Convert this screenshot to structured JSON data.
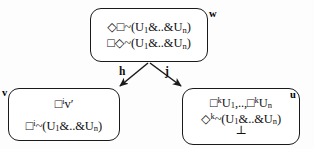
{
  "diagram": {
    "type": "modal-logic-kripke-frame",
    "background_color": "#fdfdfd",
    "stroke_color": "#1a1a1a",
    "nodes": [
      {
        "id": "w",
        "label": "w",
        "label_position": "top-right",
        "lines": [
          {
            "parts": [
              {
                "t": "◇□~(U"
              },
              {
                "t": "1",
                "style": "sub"
              },
              {
                "t": "&..&U"
              },
              {
                "t": "n",
                "style": "sub"
              },
              {
                "t": ")"
              }
            ],
            "plain": "◇□~(U1&..&Un)"
          },
          {
            "parts": [
              {
                "t": "□◇~(U"
              },
              {
                "t": "1",
                "style": "sub"
              },
              {
                "t": "&..&U"
              },
              {
                "t": "n",
                "style": "sub"
              },
              {
                "t": ")"
              }
            ],
            "plain": "□◇~(U1&..&Un)"
          }
        ]
      },
      {
        "id": "v",
        "label": "v",
        "label_position": "top-left",
        "lines": [
          {
            "parts": [
              {
                "t": "□"
              },
              {
                "t": "i",
                "style": "sup"
              },
              {
                "t": "v′"
              }
            ],
            "plain": "□iv′"
          },
          {
            "parts": [
              {
                "t": "□"
              },
              {
                "t": "i",
                "style": "sup"
              },
              {
                "t": "~(U"
              },
              {
                "t": "1",
                "style": "sub"
              },
              {
                "t": "&..&U"
              },
              {
                "t": "n",
                "style": "sub"
              },
              {
                "t": ")"
              }
            ],
            "plain": "□i~(U1&..&Un)"
          }
        ]
      },
      {
        "id": "u",
        "label": "u",
        "label_position": "top-right",
        "lines": [
          {
            "parts": [
              {
                "t": "□"
              },
              {
                "t": "k",
                "style": "sup"
              },
              {
                "t": "U"
              },
              {
                "t": "1",
                "style": "sub"
              },
              {
                "t": ",..,□"
              },
              {
                "t": "k",
                "style": "sup"
              },
              {
                "t": "U"
              },
              {
                "t": "n",
                "style": "sub"
              }
            ],
            "plain": "□kU1,..,□kUn"
          },
          {
            "parts": [
              {
                "t": "◇"
              },
              {
                "t": "k",
                "style": "sup"
              },
              {
                "t": "~(U"
              },
              {
                "t": "1",
                "style": "sub"
              },
              {
                "t": "&..&U"
              },
              {
                "t": "n",
                "style": "sub"
              },
              {
                "t": ")"
              }
            ],
            "plain": "◇k~(U1&..&Un)"
          },
          {
            "parts": [
              {
                "t": "⊥"
              }
            ],
            "plain": "⊥"
          }
        ]
      }
    ],
    "edges": [
      {
        "id": "h",
        "label": "h",
        "from": "w",
        "to": "v",
        "direction": "down-left"
      },
      {
        "id": "j",
        "label": "j",
        "from": "w",
        "to": "u",
        "direction": "down-right"
      }
    ]
  }
}
